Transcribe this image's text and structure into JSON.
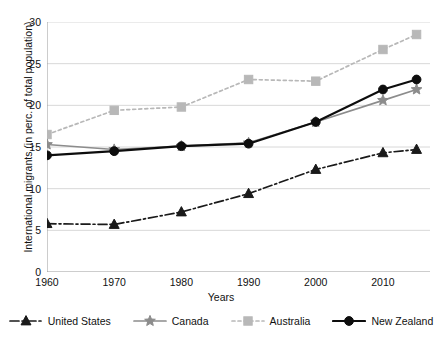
{
  "chart_data": {
    "type": "line",
    "title": "",
    "xlabel": "Years",
    "ylabel": "International migrants (in perc. of total population)",
    "x": [
      1960,
      1970,
      1980,
      1990,
      2000,
      2010,
      2015
    ],
    "xlim": [
      1960,
      2017
    ],
    "ylim": [
      0,
      30
    ],
    "xticks": [
      1960,
      1970,
      1980,
      1990,
      2000,
      2010
    ],
    "yticks": [
      0,
      5,
      10,
      15,
      20,
      25,
      30
    ],
    "grid": "horizontal",
    "legend_position": "bottom",
    "series": [
      {
        "name": "United States",
        "values": [
          5.8,
          5.7,
          7.2,
          9.4,
          12.3,
          14.3,
          14.7
        ],
        "color": "#1a1a1a",
        "marker": "triangle",
        "linestyle": "dashdot"
      },
      {
        "name": "Canada",
        "values": [
          15.3,
          14.7,
          15.1,
          15.5,
          18.0,
          20.6,
          21.9
        ],
        "color": "#8c8c8c",
        "marker": "star",
        "linestyle": "solid"
      },
      {
        "name": "Australia",
        "values": [
          16.5,
          19.4,
          19.8,
          23.1,
          22.9,
          26.7,
          28.5
        ],
        "color": "#b8b8b8",
        "marker": "square",
        "linestyle": "dotted"
      },
      {
        "name": "New Zealand",
        "values": [
          14.0,
          14.5,
          15.1,
          15.4,
          18.0,
          21.9,
          23.1
        ],
        "color": "#0d0d0d",
        "marker": "circle",
        "linestyle": "solid"
      }
    ]
  },
  "axes": {
    "ytick_labels": [
      "0",
      "5",
      "10",
      "15",
      "20",
      "25",
      "30"
    ],
    "xtick_labels": [
      "1960",
      "1970",
      "1980",
      "1990",
      "2000",
      "2010"
    ],
    "y_title": "International migrants (in perc. of total population)",
    "x_title": "Years"
  },
  "legend": {
    "items": [
      {
        "label": "United States"
      },
      {
        "label": "Canada"
      },
      {
        "label": "Australia"
      },
      {
        "label": "New Zealand"
      }
    ]
  },
  "colors": {
    "grid": "#d8d8d8",
    "axis": "#9a9a9a",
    "text": "#111111",
    "background": "#ffffff"
  }
}
